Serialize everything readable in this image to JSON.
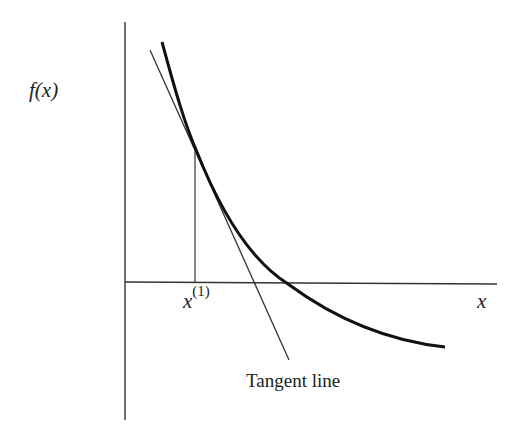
{
  "diagram": {
    "y_axis_label": "f(x)",
    "x_axis_label": "x",
    "x_marker": {
      "base": "x",
      "superscript": "(1)"
    },
    "annotation": "Tangent line",
    "colors": {
      "curve": "#111111",
      "axes": "#333333",
      "background": "#ffffff"
    }
  }
}
